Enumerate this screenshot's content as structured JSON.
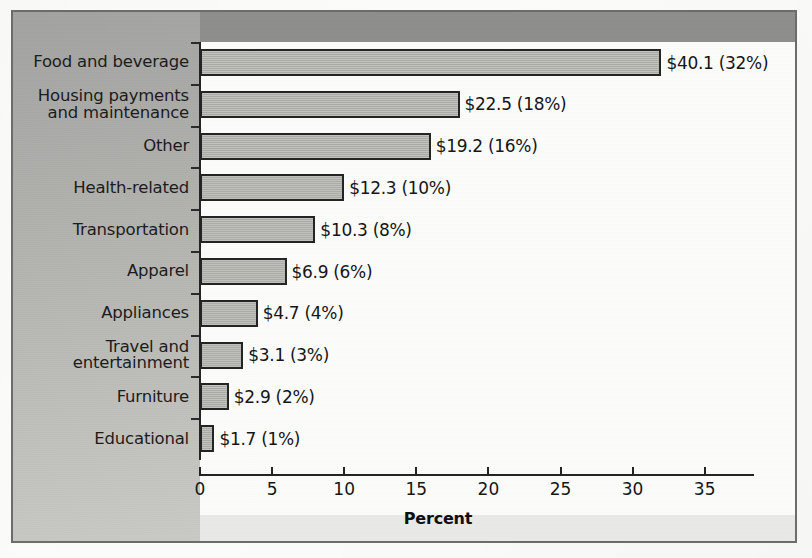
{
  "chart_data": {
    "type": "bar",
    "orientation": "horizontal",
    "title": "",
    "xlabel": "Percent",
    "ylabel": "",
    "xlim": [
      0,
      38.5
    ],
    "grid": false,
    "legend": null,
    "xticks": [
      0,
      5,
      10,
      15,
      20,
      25,
      30,
      35
    ],
    "xtick_labels": [
      "0",
      "5",
      "10",
      "15",
      "20",
      "25",
      "30",
      "35"
    ],
    "categories": [
      "Food and beverage",
      "Housing payments\nand maintenance",
      "Other",
      "Health-related",
      "Transportation",
      "Apparel",
      "Appliances",
      "Travel and\nentertainment",
      "Furniture",
      "Educational"
    ],
    "values": [
      32,
      18,
      16,
      10,
      8,
      6,
      4,
      3,
      2,
      1
    ],
    "amounts": [
      40.1,
      22.5,
      19.2,
      12.3,
      10.3,
      6.9,
      4.7,
      3.1,
      2.9,
      1.7
    ],
    "data_labels": [
      "$40.1 (32%)",
      "$22.5 (18%)",
      "$19.2 (16%)",
      "$12.3 (10%)",
      "$10.3 (8%)",
      "$6.9 (6%)",
      "$4.7 (4%)",
      "$3.1 (3%)",
      "$2.9 (2%)",
      "$1.7 (1%)"
    ]
  },
  "style": {
    "bar_fill": "#adadaa",
    "bar_stroke": "#232323",
    "panel_gray": "#b3b3b0",
    "plot_bg": "#fcfcfb",
    "frame_border": "#6c6c6c",
    "top_band": "#8e8e8c",
    "text_color": "#141414"
  }
}
